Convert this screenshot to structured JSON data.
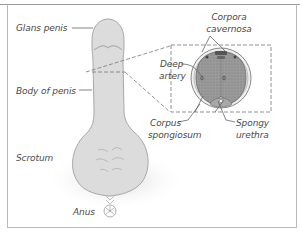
{
  "diagram": {
    "title": "",
    "labels": {
      "glans_penis": "Glans penis",
      "body_of_penis": "Body of penis",
      "scrotum": "Scrotum",
      "anus": "Anus",
      "corpora_cavernosa_line1": "Corpora",
      "corpora_cavernosa_line2": "cavernosa",
      "deep_artery_line1": "Deep",
      "deep_artery_line2": "artery",
      "corpus_spongiosum_line1": "Corpus",
      "corpus_spongiosum_line2": "spongiosum",
      "spongy_urethra_line1": "Spongy",
      "spongy_urethra_line2": "urethra"
    },
    "colors": {
      "skin": "#d9d9d9",
      "skin_outline": "#a8a8a8",
      "tissue": "#8f8f8f",
      "label_text": "#4a4a4a",
      "frame": "#b8b8b8"
    }
  }
}
